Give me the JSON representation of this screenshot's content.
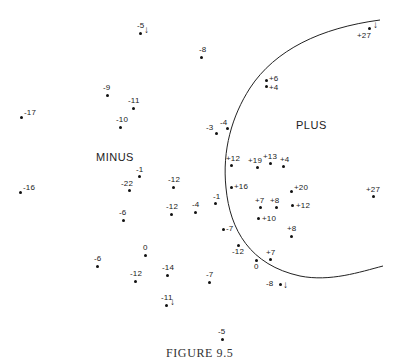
{
  "figure": {
    "caption": "FIGURE 9.5",
    "region_labels": {
      "minus": "MINUS",
      "plus": "PLUS"
    },
    "boundary_curve": "boundary separating PLUS region (right) from MINUS region (left)"
  },
  "chart_data": {
    "type": "scatter",
    "title": "",
    "caption": "FIGURE 9.5",
    "xlabel": "",
    "ylabel": "",
    "grid": false,
    "annotations": [
      "MINUS",
      "PLUS"
    ],
    "points": [
      {
        "x": 140,
        "y": 33,
        "label": "-5",
        "arrow": "down"
      },
      {
        "x": 201,
        "y": 57,
        "label": "-8"
      },
      {
        "x": 369,
        "y": 28,
        "label": "+27",
        "arrow": "down"
      },
      {
        "x": 107,
        "y": 95,
        "label": "-9"
      },
      {
        "x": 133,
        "y": 108,
        "label": "-11"
      },
      {
        "x": 21,
        "y": 117,
        "label": "-17"
      },
      {
        "x": 120,
        "y": 127,
        "label": "-10"
      },
      {
        "x": 266,
        "y": 80,
        "label": "+6"
      },
      {
        "x": 266,
        "y": 86,
        "label": "+4"
      },
      {
        "x": 216,
        "y": 133,
        "label": "-3"
      },
      {
        "x": 227,
        "y": 128,
        "label": "-4"
      },
      {
        "x": 20,
        "y": 192,
        "label": "-16"
      },
      {
        "x": 139,
        "y": 176,
        "label": "-1"
      },
      {
        "x": 129,
        "y": 190,
        "label": "-22"
      },
      {
        "x": 173,
        "y": 187,
        "label": "-12"
      },
      {
        "x": 123,
        "y": 220,
        "label": "-6"
      },
      {
        "x": 171,
        "y": 214,
        "label": "-12"
      },
      {
        "x": 195,
        "y": 212,
        "label": "-4"
      },
      {
        "x": 215,
        "y": 203,
        "label": "-1"
      },
      {
        "x": 231,
        "y": 165,
        "label": "+12"
      },
      {
        "x": 257,
        "y": 167,
        "label": "+19"
      },
      {
        "x": 270,
        "y": 163,
        "label": "+13"
      },
      {
        "x": 283,
        "y": 166,
        "label": "+4"
      },
      {
        "x": 231,
        "y": 187,
        "label": "+16"
      },
      {
        "x": 291,
        "y": 191,
        "label": "+20"
      },
      {
        "x": 373,
        "y": 196,
        "label": "+27"
      },
      {
        "x": 260,
        "y": 207,
        "label": "+7"
      },
      {
        "x": 276,
        "y": 207,
        "label": "+8"
      },
      {
        "x": 292,
        "y": 205,
        "label": "+12"
      },
      {
        "x": 258,
        "y": 218,
        "label": "+10"
      },
      {
        "x": 223,
        "y": 229,
        "label": "-7"
      },
      {
        "x": 291,
        "y": 236,
        "label": "+8"
      },
      {
        "x": 238,
        "y": 245,
        "label": "-12"
      },
      {
        "x": 256,
        "y": 260,
        "label": "0"
      },
      {
        "x": 270,
        "y": 259,
        "label": "+7"
      },
      {
        "x": 280,
        "y": 284,
        "label": "-8",
        "arrow": "down"
      },
      {
        "x": 145,
        "y": 255,
        "label": "0"
      },
      {
        "x": 97,
        "y": 266,
        "label": "-6"
      },
      {
        "x": 135,
        "y": 281,
        "label": "-12"
      },
      {
        "x": 167,
        "y": 275,
        "label": "-14"
      },
      {
        "x": 209,
        "y": 282,
        "label": "-7"
      },
      {
        "x": 166,
        "y": 305,
        "label": "-11",
        "arrow": "down"
      },
      {
        "x": 222,
        "y": 339,
        "label": "-5"
      }
    ]
  }
}
